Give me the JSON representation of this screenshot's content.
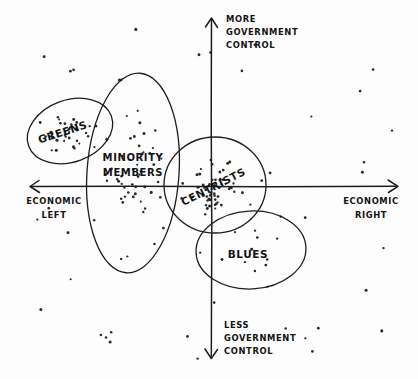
{
  "diagram": {
    "background_color": "#fdfdfd",
    "ink_color": "#1d1d1d"
  },
  "axes": {
    "vertical": {
      "top_label_lines": [
        "MORE",
        "GOVERNMENT",
        "CONTROL"
      ],
      "bottom_label_lines": [
        "LESS",
        "GOVERNMENT",
        "CONTROL"
      ],
      "top_label_text": "MORE GOVERNMENT CONTROL",
      "bottom_label_text": "LESS GOVERNMENT CONTROL",
      "x_position": 211,
      "y_top": 18,
      "y_bottom": 358
    },
    "horizontal": {
      "left_label_lines": [
        "ECONOMIC",
        "LEFT"
      ],
      "right_label_lines": [
        "ECONOMIC",
        "RIGHT"
      ],
      "left_label_text": "ECONOMIC LEFT",
      "right_label_text": "ECONOMIC RIGHT",
      "y_position": 186,
      "x_left": 30,
      "x_right": 398
    }
  },
  "groups": [
    {
      "id": "greens",
      "label": "GREENS.",
      "label_lines": [
        "GREENS."
      ],
      "cx": 70,
      "cy": 131,
      "rx": 44,
      "ry": 31,
      "rotation": -20,
      "label_rotation": -18,
      "label_x": 66,
      "label_y": 135,
      "quadrant": "upper-left"
    },
    {
      "id": "minority-members",
      "label": "MINORITY MEMBERS",
      "label_lines": [
        "MINORITY",
        "MEMBERS"
      ],
      "cx": 133,
      "cy": 173,
      "rx": 46,
      "ry": 100,
      "rotation": 4,
      "label_rotation": 0,
      "label_x": 133,
      "label_y": 161,
      "quadrant": "left-center"
    },
    {
      "id": "centrists",
      "label": "CENTRISTS",
      "label_lines": [
        "CENTRISTS"
      ],
      "cx": 215,
      "cy": 185,
      "rx": 51,
      "ry": 48,
      "rotation": 0,
      "label_rotation": -27,
      "label_x": 215,
      "label_y": 190,
      "quadrant": "center"
    },
    {
      "id": "blues",
      "label": "BLUES",
      "label_lines": [
        "BLUES"
      ],
      "cx": 251,
      "cy": 250,
      "rx": 55,
      "ry": 39,
      "rotation": -3,
      "label_rotation": 0,
      "label_x": 248,
      "label_y": 258,
      "quadrant": "lower-right"
    }
  ],
  "scatter": {
    "dot_count": 188,
    "dot_radius": 1.05,
    "dot_color": "#2a2a2a",
    "description": "Hand-drawn dot cloud of voters, densest in the centrists and minority-members regions"
  }
}
